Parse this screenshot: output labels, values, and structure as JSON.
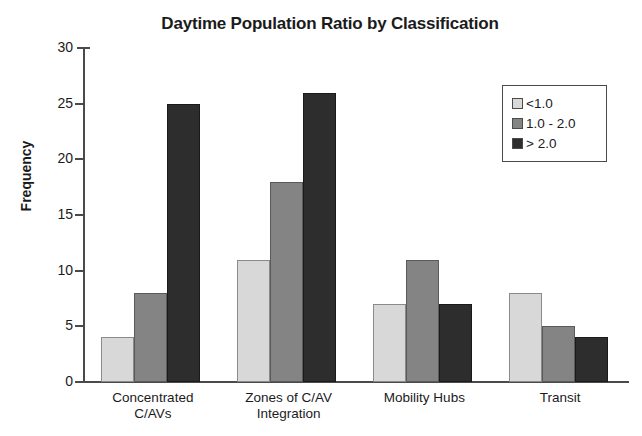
{
  "chart_data": {
    "type": "bar",
    "title": "Daytime Population Ratio by Classification",
    "xlabel": "",
    "ylabel": "Frequency",
    "ylim": [
      0,
      30
    ],
    "ytick_step": 5,
    "yticks": [
      0,
      5,
      10,
      15,
      20,
      25,
      30
    ],
    "grid": false,
    "legend_position": "upper right",
    "categories": [
      "Concentrated C/AVs",
      "Zones of C/AV Integration",
      "Mobility Hubs",
      "Transit"
    ],
    "category_lines": [
      [
        "Concentrated",
        "C/AVs"
      ],
      [
        "Zones of C/AV",
        "Integration"
      ],
      [
        "Mobility Hubs",
        ""
      ],
      [
        "Transit",
        ""
      ]
    ],
    "series": [
      {
        "name": "<1.0",
        "color": "#d8d8d8",
        "values": [
          4,
          11,
          7,
          8
        ]
      },
      {
        "name": "1.0 - 2.0",
        "color": "#848484",
        "values": [
          8,
          18,
          11,
          5
        ]
      },
      {
        "name": "> 2.0",
        "color": "#2d2d2d",
        "values": [
          25,
          26,
          7,
          4
        ]
      }
    ]
  },
  "legend": {
    "items": [
      {
        "label": "<1.0"
      },
      {
        "label": "1.0 - 2.0"
      },
      {
        "label": "> 2.0"
      }
    ]
  },
  "axis": {
    "y_title": "Frequency",
    "y_tick_labels": [
      "30",
      "25",
      "20",
      "15",
      "10",
      "5",
      "0"
    ]
  }
}
